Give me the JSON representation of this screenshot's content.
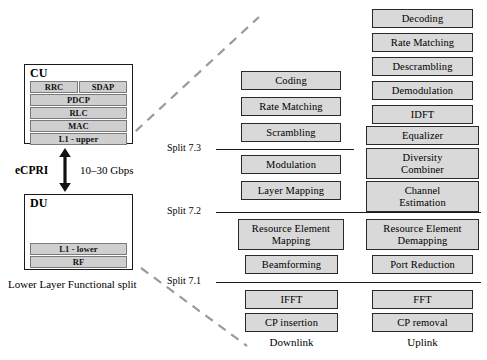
{
  "diagram": {
    "caption": "Lower Layer Functional split",
    "link": {
      "protocol_label": "eCPRI",
      "rate_label": "10–30 Gbps",
      "arrow_icon": "double-headed-vertical-arrow-icon"
    }
  },
  "cu": {
    "title": "CU",
    "layers": [
      {
        "label": "RRC"
      },
      {
        "label": "SDAP"
      },
      {
        "label": "PDCP"
      },
      {
        "label": "RLC"
      },
      {
        "label": "MAC"
      },
      {
        "label": "L1 - upper"
      }
    ]
  },
  "du": {
    "title": "DU",
    "layers": [
      {
        "label": "L1 - lower"
      },
      {
        "label": "RF"
      }
    ]
  },
  "splits": [
    {
      "label": "Split 7.3"
    },
    {
      "label": "Split 7.2"
    },
    {
      "label": "Split 7.1"
    }
  ],
  "columns": [
    {
      "name": "downlink",
      "caption": "Downlink",
      "blocks": [
        {
          "label": "Coding"
        },
        {
          "label": "Rate Matching"
        },
        {
          "label": "Scrambling"
        },
        {
          "label": "Modulation"
        },
        {
          "label": "Layer Mapping"
        },
        {
          "label": "Resource Element\nMapping"
        },
        {
          "label": "Beamforming"
        },
        {
          "label": "IFFT"
        },
        {
          "label": "CP insertion"
        }
      ]
    },
    {
      "name": "uplink",
      "caption": "Uplink",
      "blocks": [
        {
          "label": "Decoding"
        },
        {
          "label": "Rate Matching"
        },
        {
          "label": "Descrambling"
        },
        {
          "label": "Demodulation"
        },
        {
          "label": "IDFT"
        },
        {
          "label": "Equalizer"
        },
        {
          "label": "Diversity\nCombiner"
        },
        {
          "label": "Channel\nEstimation"
        },
        {
          "label": "Resource Element\nDemapping"
        },
        {
          "label": "Port Reduction"
        },
        {
          "label": "FFT"
        },
        {
          "label": "CP removal"
        }
      ]
    }
  ],
  "colors": {
    "block_fill": "#d9d9d9",
    "block_border": "#2a2a2a",
    "layer_fill": "#cfcfcf",
    "dashed_connector": "#9a9a9a",
    "line": "#1a1a1a"
  }
}
